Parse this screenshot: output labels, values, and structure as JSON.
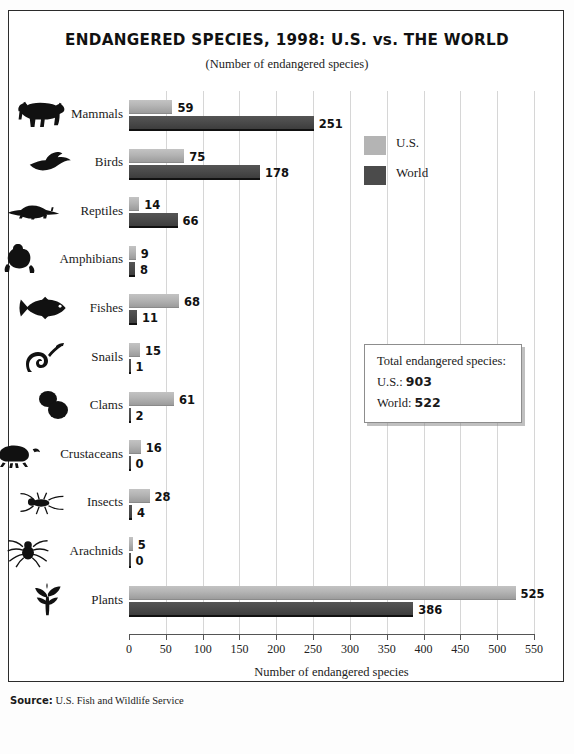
{
  "title": "ENDANGERED SPECIES, 1998: U.S. vs. THE WORLD",
  "subtitle": "(Number of endangered species)",
  "legend": {
    "us_label": "U.S.",
    "world_label": "World"
  },
  "totals": {
    "heading": "Total endangered species:",
    "us_prefix": "U.S.: ",
    "us_value": "903",
    "world_prefix": "World: ",
    "world_value": "522"
  },
  "source": {
    "label": "Source:",
    "value": "U.S. Fish and Wildlife Service"
  },
  "colors": {
    "us": "#b4b4b4",
    "world": "#4b4b4b",
    "grid": "#d6d6d6",
    "axis": "#555555",
    "frame": "#2b2b2b"
  },
  "icons": [
    "cow-icon",
    "bird-icon",
    "lizard-icon",
    "frog-icon",
    "fish-icon",
    "snail-icon",
    "clam-icon",
    "crab-icon",
    "insect-icon",
    "spider-icon",
    "plant-icon"
  ],
  "chart_data": {
    "type": "bar",
    "orientation": "horizontal",
    "title": "ENDANGERED SPECIES, 1998: U.S. vs. THE WORLD",
    "subtitle": "(Number of endangered species)",
    "xlabel": "Number of endangered species",
    "ylabel": "",
    "xlim": [
      0,
      550
    ],
    "xticks": [
      0,
      50,
      100,
      150,
      200,
      250,
      300,
      350,
      400,
      450,
      500,
      550
    ],
    "xtick_labels": [
      "0",
      "50",
      "100",
      "150",
      "200",
      "250",
      "300",
      "350",
      "400",
      "450",
      "500",
      "550"
    ],
    "grid": true,
    "legend_position": "right-upper",
    "categories": [
      "Mammals",
      "Birds",
      "Reptiles",
      "Amphibians",
      "Fishes",
      "Snails",
      "Clams",
      "Crustaceans",
      "Insects",
      "Arachnids",
      "Plants"
    ],
    "series": [
      {
        "name": "U.S.",
        "color": "#b4b4b4",
        "values": [
          59,
          75,
          14,
          9,
          68,
          15,
          61,
          16,
          28,
          5,
          525
        ],
        "labels": [
          "59",
          "75",
          "14",
          "9",
          "68",
          "15",
          "61",
          "16",
          "28",
          "5",
          "525"
        ]
      },
      {
        "name": "World",
        "color": "#4b4b4b",
        "values": [
          251,
          178,
          66,
          8,
          11,
          1,
          2,
          0,
          4,
          0,
          386
        ],
        "labels": [
          "251",
          "178",
          "66",
          "8",
          "11",
          "1",
          "2",
          "0",
          "4",
          "0",
          "386"
        ]
      }
    ],
    "annotations": [
      "Total endangered species:",
      "U.S.: 903",
      "World: 522"
    ],
    "source": "Source: U.S. Fish and Wildlife Service"
  }
}
